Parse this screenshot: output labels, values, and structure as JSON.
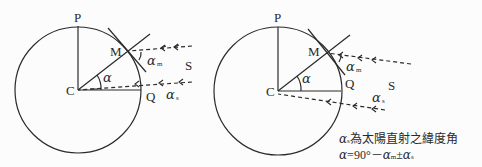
{
  "diagrams": [
    {
      "id": "left",
      "labels": {
        "P": "P",
        "M": "M",
        "C": "C",
        "Q": "Q",
        "S": "S",
        "alpha": "α",
        "alpha_m": "α",
        "alpha_m_sub": "m",
        "alpha_s": "α",
        "alpha_s_sub": "s"
      }
    },
    {
      "id": "right",
      "labels": {
        "P": "P",
        "M": "M",
        "C": "C",
        "Q": "Q",
        "S": "S",
        "alpha": "α",
        "alpha_m": "α",
        "alpha_m_sub": "m",
        "alpha_s": "α",
        "alpha_s_sub": "s"
      }
    }
  ],
  "notes": {
    "line1_symbol": "α",
    "line1_sub": "s",
    "line1_text": "為太陽直射之緯度角",
    "line2_symbol": "α",
    "line2_eq": "=90°－",
    "line2_alpha_m": "α",
    "line2_m_sub": "m",
    "line2_pm": "±",
    "line2_alpha_s": "α",
    "line2_s_sub": "s"
  },
  "colors": {
    "stroke": "#2a2a2a",
    "background": "#fcfcfc"
  }
}
